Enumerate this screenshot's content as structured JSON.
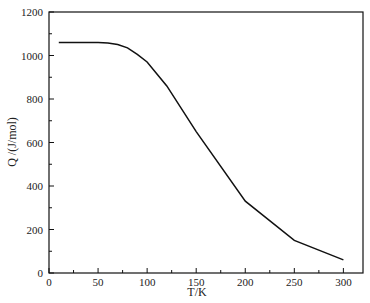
{
  "chart_data": {
    "type": "line",
    "title": "",
    "xlabel": "T/K",
    "ylabel": "Q /(J/mol)",
    "xlim": [
      0,
      320
    ],
    "ylim": [
      0,
      1200
    ],
    "xticks": [
      0,
      50,
      100,
      150,
      200,
      250,
      300
    ],
    "yticks": [
      0,
      200,
      400,
      600,
      800,
      1000,
      1200
    ],
    "grid": false,
    "legend": null,
    "series": [
      {
        "name": "Q",
        "color": "#111111",
        "x": [
          10,
          30,
          50,
          60,
          70,
          80,
          90,
          100,
          120,
          150,
          200,
          250,
          300
        ],
        "y": [
          1060,
          1060,
          1060,
          1058,
          1050,
          1035,
          1005,
          970,
          860,
          650,
          330,
          150,
          60
        ]
      }
    ]
  }
}
